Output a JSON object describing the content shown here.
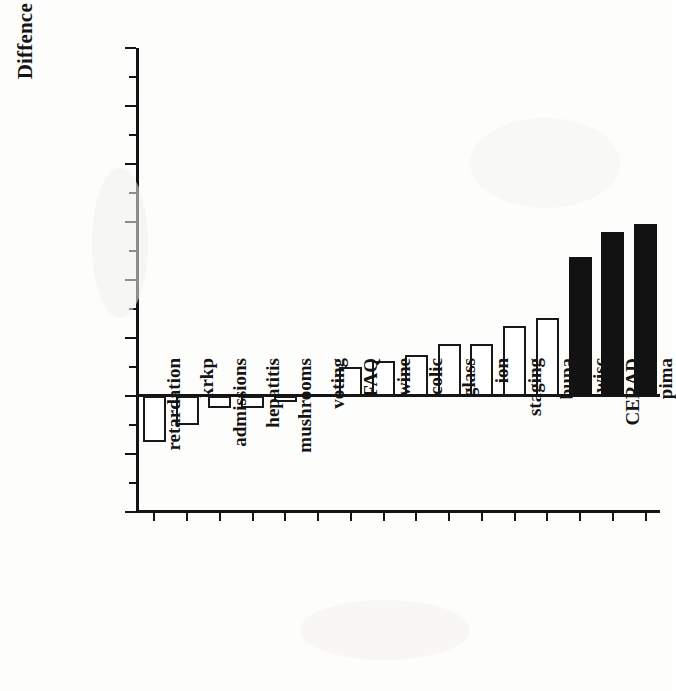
{
  "chart_data": {
    "type": "bar",
    "title": "",
    "xlabel": "",
    "ylabel": "Diffence in Accuracy",
    "ylim": [
      -0.02,
      0.06
    ],
    "ytick_labels": [
      "0.06",
      "0.05",
      "0.04",
      "0.03",
      "0.02",
      "0.01",
      "0.00",
      "-0.01",
      "-0.02"
    ],
    "ytick_values": [
      0.06,
      0.05,
      0.04,
      0.03,
      0.02,
      0.01,
      0.0,
      -0.01,
      -0.02
    ],
    "minor_tick_step": 0.005,
    "grid": false,
    "legend": null,
    "categories": [
      "retardation",
      "krkp",
      "admissions",
      "hepatitis",
      "mushrooms",
      "voting",
      "FAQ",
      "wine",
      "colic",
      "glass",
      "ion",
      "staging",
      "bupa",
      "wisc",
      "CERAD",
      "pima"
    ],
    "values": [
      -0.008,
      -0.005,
      -0.002,
      -0.002,
      -0.001,
      0.0,
      0.005,
      0.006,
      0.007,
      0.009,
      0.009,
      0.012,
      0.0135,
      0.024,
      0.0283,
      0.0297
    ],
    "fills": [
      "open",
      "open",
      "open",
      "open",
      "open",
      "open",
      "open",
      "open",
      "open",
      "open",
      "open",
      "open",
      "open",
      "filled",
      "filled",
      "filled"
    ],
    "colors": {
      "open_fill": "#ffffff",
      "open_edge": "#181818",
      "filled_fill": "#121212",
      "axis": "#141414",
      "background": "#fdfdfc"
    }
  }
}
